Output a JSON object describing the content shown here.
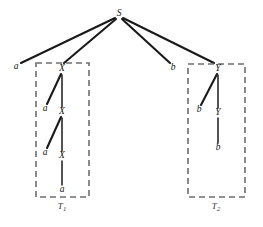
{
  "figure": {
    "background_color": "#ffffff",
    "edge_color": "#1a1a1a",
    "box_color": "#6e6e6e",
    "width": 263,
    "height": 227,
    "root": {
      "label": "S",
      "x": 119,
      "y": 14
    },
    "outer_leaves": [
      {
        "label": "a",
        "x": 16,
        "y": 67
      },
      {
        "label": "b",
        "x": 173,
        "y": 68
      }
    ],
    "subtree_1": {
      "caption": "T",
      "caption_sub": "1",
      "caption_x": 62,
      "caption_y": 207,
      "box": {
        "x": 36,
        "y": 63,
        "width": 53,
        "height": 134
      },
      "nodes": [
        {
          "label": "X",
          "x": 62,
          "y": 69
        },
        {
          "label": "a",
          "x": 45,
          "y": 109
        },
        {
          "label": "X",
          "x": 62,
          "y": 112
        },
        {
          "label": "a",
          "x": 45,
          "y": 153
        },
        {
          "label": "X",
          "x": 62,
          "y": 156
        },
        {
          "label": "a",
          "x": 62,
          "y": 190
        }
      ],
      "edges": [
        {
          "x1": 61,
          "y1": 74,
          "x2": 47,
          "y2": 104
        },
        {
          "x1": 62,
          "y1": 75,
          "x2": 62,
          "y2": 107
        },
        {
          "x1": 61,
          "y1": 117,
          "x2": 47,
          "y2": 148
        },
        {
          "x1": 62,
          "y1": 118,
          "x2": 62,
          "y2": 151
        },
        {
          "x1": 62,
          "y1": 161,
          "x2": 62,
          "y2": 185
        }
      ]
    },
    "subtree_2": {
      "caption": "T",
      "caption_sub": "2",
      "caption_x": 216,
      "caption_y": 207,
      "box": {
        "x": 188,
        "y": 64,
        "width": 57,
        "height": 133
      },
      "nodes": [
        {
          "label": "Y",
          "x": 218,
          "y": 69
        },
        {
          "label": "b",
          "x": 199,
          "y": 110
        },
        {
          "label": "Y",
          "x": 218,
          "y": 113
        },
        {
          "label": "b",
          "x": 218,
          "y": 148
        }
      ],
      "edges": [
        {
          "x1": 217,
          "y1": 74,
          "x2": 201,
          "y2": 105
        },
        {
          "x1": 218,
          "y1": 75,
          "x2": 218,
          "y2": 108
        },
        {
          "x1": 218,
          "y1": 118,
          "x2": 218,
          "y2": 143
        }
      ]
    },
    "root_edges": [
      {
        "x1": 115,
        "y1": 18,
        "x2": 21,
        "y2": 63
      },
      {
        "x1": 116,
        "y1": 19,
        "x2": 64,
        "y2": 63
      },
      {
        "x1": 122,
        "y1": 19,
        "x2": 170,
        "y2": 63
      },
      {
        "x1": 123,
        "y1": 18,
        "x2": 214,
        "y2": 63
      }
    ]
  }
}
